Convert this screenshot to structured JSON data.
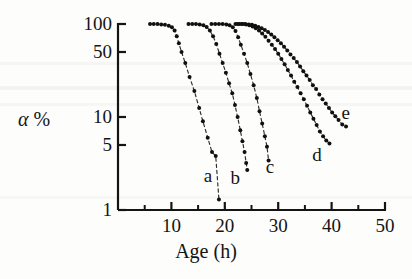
{
  "chart_data": {
    "type": "scatter",
    "title": "",
    "subtitle": "",
    "xlabel": "Age (h)",
    "ylabel": "α %",
    "ylabel_alpha": "α",
    "ylabel_percent": "%",
    "xscale": "linear",
    "yscale": "log",
    "xlim": [
      0,
      50
    ],
    "ylim": [
      1,
      100
    ],
    "grid": false,
    "legend": "inline-curve-labels",
    "xticks": [
      10,
      20,
      30,
      40,
      50
    ],
    "xtick_labels": [
      "10",
      "20",
      "30",
      "40",
      "50"
    ],
    "xminorticks": [
      5,
      15,
      25,
      35,
      45
    ],
    "yticks": [
      100,
      50,
      10,
      5,
      1
    ],
    "ytick_labels": [
      "100",
      "50",
      "10",
      "5",
      "1"
    ],
    "marker": "filled-circle",
    "line_style": "dashed-connecting",
    "series": [
      {
        "name": "a",
        "label": "a",
        "label_x": 17.0,
        "label_y": 2.3,
        "points": [
          [
            6.0,
            100
          ],
          [
            6.7,
            100
          ],
          [
            7.4,
            100
          ],
          [
            8.1,
            99
          ],
          [
            8.8,
            98
          ],
          [
            9.5,
            96
          ],
          [
            10.1,
            92
          ],
          [
            10.6,
            85
          ],
          [
            11.0,
            74
          ],
          [
            11.4,
            62
          ],
          [
            11.9,
            50
          ],
          [
            12.6,
            38
          ],
          [
            13.4,
            27
          ],
          [
            14.3,
            19
          ],
          [
            15.2,
            12.5
          ],
          [
            15.9,
            9.0
          ],
          [
            16.8,
            6.0
          ],
          [
            17.6,
            4.2
          ],
          [
            18.3,
            3.8
          ],
          [
            18.9,
            1.3
          ]
        ]
      },
      {
        "name": "b",
        "label": "b",
        "label_x": 22.0,
        "label_y": 2.2,
        "points": [
          [
            13.2,
            100
          ],
          [
            13.9,
            100
          ],
          [
            14.6,
            100
          ],
          [
            15.3,
            99
          ],
          [
            16.0,
            97
          ],
          [
            16.6,
            93
          ],
          [
            17.2,
            85
          ],
          [
            17.8,
            74
          ],
          [
            18.4,
            61
          ],
          [
            19.0,
            48
          ],
          [
            19.6,
            38
          ],
          [
            20.2,
            30
          ],
          [
            20.8,
            23
          ],
          [
            21.4,
            18
          ],
          [
            21.9,
            13.5
          ],
          [
            22.4,
            10.0
          ],
          [
            22.9,
            7.2
          ],
          [
            23.3,
            5.5
          ],
          [
            23.7,
            4.2
          ],
          [
            24.0,
            3.2
          ],
          [
            24.2,
            2.7
          ]
        ]
      },
      {
        "name": "c",
        "label": "c",
        "label_x": 28.6,
        "label_y": 2.9,
        "points": [
          [
            17.5,
            100
          ],
          [
            18.2,
            100
          ],
          [
            18.9,
            100
          ],
          [
            19.6,
            100
          ],
          [
            20.3,
            99
          ],
          [
            20.9,
            97
          ],
          [
            21.5,
            92
          ],
          [
            22.0,
            84
          ],
          [
            22.5,
            72
          ],
          [
            23.0,
            60
          ],
          [
            23.6,
            48
          ],
          [
            24.2,
            38
          ],
          [
            24.8,
            29
          ],
          [
            25.4,
            22
          ],
          [
            26.0,
            16
          ],
          [
            26.5,
            11.5
          ],
          [
            27.0,
            8.5
          ],
          [
            27.5,
            6.2
          ],
          [
            27.9,
            4.8
          ],
          [
            28.2,
            3.4
          ]
        ]
      },
      {
        "name": "d",
        "label": "d",
        "label_x": 37.3,
        "label_y": 3.9,
        "points": [
          [
            22.0,
            100
          ],
          [
            22.7,
            100
          ],
          [
            23.4,
            100
          ],
          [
            24.0,
            99
          ],
          [
            24.6,
            97
          ],
          [
            25.2,
            94
          ],
          [
            25.8,
            90
          ],
          [
            26.4,
            85
          ],
          [
            27.0,
            79
          ],
          [
            27.6,
            73
          ],
          [
            28.2,
            66
          ],
          [
            28.8,
            60
          ],
          [
            29.4,
            54
          ],
          [
            30.0,
            48
          ],
          [
            30.6,
            42
          ],
          [
            31.2,
            37
          ],
          [
            31.8,
            32
          ],
          [
            32.4,
            28
          ],
          [
            33.0,
            24
          ],
          [
            33.6,
            21
          ],
          [
            34.2,
            18
          ],
          [
            34.8,
            15.5
          ],
          [
            35.4,
            13.2
          ],
          [
            36.0,
            11.2
          ],
          [
            36.6,
            9.6
          ],
          [
            37.2,
            8.2
          ],
          [
            37.8,
            7.0
          ],
          [
            38.4,
            6.2
          ],
          [
            39.0,
            5.6
          ],
          [
            39.6,
            5.2
          ]
        ]
      },
      {
        "name": "e",
        "label": "e",
        "label_x": 42.8,
        "label_y": 11.0,
        "points": [
          [
            22.4,
            100
          ],
          [
            23.1,
            100
          ],
          [
            23.8,
            100
          ],
          [
            24.5,
            99
          ],
          [
            25.1,
            98
          ],
          [
            25.7,
            96
          ],
          [
            26.3,
            93
          ],
          [
            26.9,
            90
          ],
          [
            27.5,
            86
          ],
          [
            28.1,
            82
          ],
          [
            28.7,
            77
          ],
          [
            29.3,
            72
          ],
          [
            29.9,
            67
          ],
          [
            30.5,
            62
          ],
          [
            31.1,
            57
          ],
          [
            31.7,
            52
          ],
          [
            32.3,
            47
          ],
          [
            32.9,
            43
          ],
          [
            33.5,
            39
          ],
          [
            34.1,
            35
          ],
          [
            34.7,
            31
          ],
          [
            35.3,
            28
          ],
          [
            35.9,
            25
          ],
          [
            36.5,
            22
          ],
          [
            37.1,
            20
          ],
          [
            37.7,
            17.5
          ],
          [
            38.3,
            15.5
          ],
          [
            38.9,
            14.0
          ],
          [
            39.5,
            12.5
          ],
          [
            40.1,
            11.2
          ],
          [
            40.7,
            10.2
          ],
          [
            41.3,
            9.3
          ],
          [
            42.0,
            8.3
          ],
          [
            42.7,
            7.9
          ]
        ]
      }
    ]
  }
}
